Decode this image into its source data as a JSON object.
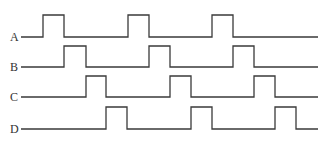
{
  "diagram": {
    "type": "timing-diagram",
    "line_color": "#3a3a3a",
    "label_color": "#333333",
    "x_start": 21,
    "x_end": 318,
    "pulse_width": 21,
    "period": 84,
    "signals": [
      {
        "label": "A",
        "label_x": 10,
        "low_y": 37,
        "high_y": 15,
        "pulses": [
          [
            43,
            64
          ],
          [
            128,
            149
          ],
          [
            212,
            233
          ]
        ]
      },
      {
        "label": "B",
        "label_x": 10,
        "low_y": 67,
        "high_y": 46,
        "pulses": [
          [
            64,
            86
          ],
          [
            149,
            170
          ],
          [
            233,
            254
          ]
        ]
      },
      {
        "label": "C",
        "label_x": 10,
        "low_y": 97,
        "high_y": 76,
        "pulses": [
          [
            86,
            106
          ],
          [
            170,
            191
          ],
          [
            254,
            275
          ]
        ]
      },
      {
        "label": "D",
        "label_x": 10,
        "low_y": 129,
        "high_y": 107,
        "pulses": [
          [
            106,
            127
          ],
          [
            191,
            212
          ],
          [
            275,
            296
          ]
        ]
      }
    ]
  }
}
